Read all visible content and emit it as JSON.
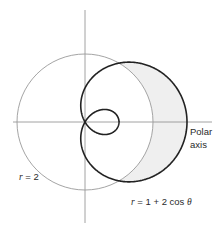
{
  "diagram": {
    "origin_px": [
      85,
      122
    ],
    "scale_px_per_unit": 34,
    "axes": {
      "horizontal": {
        "x1": 13,
        "x2": 212
      },
      "vertical": {
        "y1": 10,
        "y2": 223
      }
    },
    "curves": [
      {
        "name": "circle",
        "equation": "r = 2",
        "radius": 2,
        "stroke": "#9a9a9a"
      },
      {
        "name": "limacon",
        "equation": "r = 1 + 2 cos θ",
        "a": 1,
        "b": 2,
        "stroke": "#222222"
      }
    ],
    "shaded_region": {
      "description": "inside limaçon, outside circle",
      "fill": "#efefef"
    },
    "labels": {
      "circle": {
        "prefix": "r",
        "rest": " = 2"
      },
      "limacon": {
        "prefix": "r",
        "rest": " = 1 + 2 cos ",
        "theta": "θ"
      },
      "polar_axis_line1": "Polar",
      "polar_axis_line2": "axis"
    }
  }
}
